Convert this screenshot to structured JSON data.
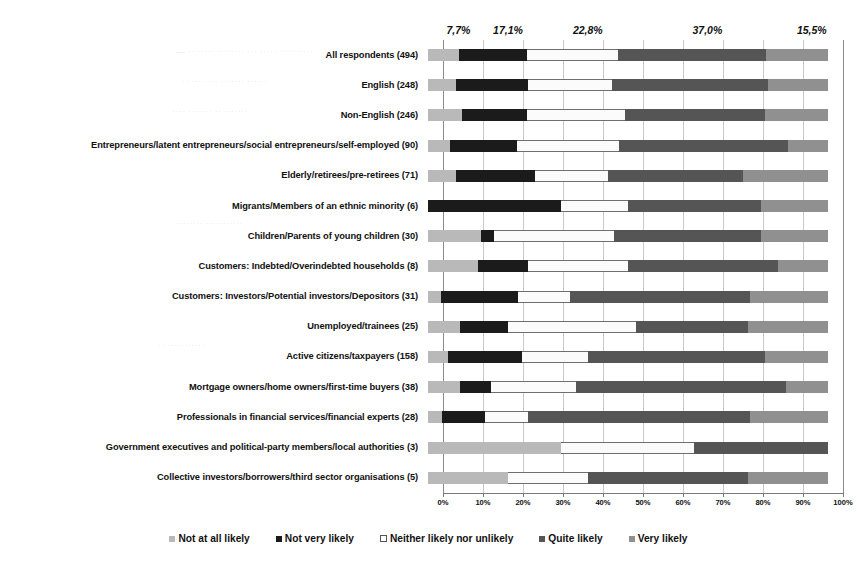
{
  "chart_data": {
    "type": "bar",
    "subtype": "stacked-horizontal-100",
    "title": "",
    "xlabel": "",
    "ylabel": "",
    "xlim": [
      0,
      100
    ],
    "grid": true,
    "legend_position": "bottom",
    "xticks": [
      "0%",
      "10%",
      "20%",
      "30%",
      "40%",
      "50%",
      "60%",
      "70%",
      "80%",
      "90%",
      "100%"
    ],
    "xtick_values": [
      0,
      10,
      20,
      30,
      40,
      50,
      60,
      70,
      80,
      90,
      100
    ],
    "legend": [
      "Not at all likely",
      "Not very likely",
      "Neither likely nor unlikely",
      "Quite likely",
      "Very likely"
    ],
    "series_colors": [
      "#b9b9b9",
      "#1b1b1b",
      "#fbfbfb",
      "#555555",
      "#909090"
    ],
    "top_value_labels": [
      "7,7%",
      "17,1%",
      "22,8%",
      "37,0%",
      "15,5%"
    ],
    "top_value_positions": [
      3.85,
      16.25,
      36.2,
      66.1,
      92.2
    ],
    "categories": [
      "All respondents (494)",
      "English (248)",
      "Non-English (246)",
      "Entrepreneurs/latent entrepreneurs/social entrepreneurs/self-employed (90)",
      "Elderly/retirees/pre-retirees (71)",
      "Migrants/Members of an ethnic minority (6)",
      "Children/Parents of young children (30)",
      "Customers: Indebted/Overindebted households (8)",
      "Customers: Investors/Potential investors/Depositors (31)",
      "Unemployed/trainees (25)",
      "Active citizens/taxpayers (158)",
      "Mortgage owners/home owners/first-time buyers (38)",
      "Professionals in financial services/financial experts (28)",
      "Government executives and political-party members/local authorities (3)",
      "Collective investors/borrowers/third sector organisations (5)"
    ],
    "series": [
      {
        "name": "Not at all likely",
        "values": [
          7.7,
          6.9,
          8.5,
          5.6,
          7.0,
          0.0,
          13.3,
          12.5,
          3.2,
          8.0,
          5.1,
          7.9,
          3.6,
          33.3,
          20.0
        ]
      },
      {
        "name": "Not very likely",
        "values": [
          17.1,
          18.1,
          16.3,
          16.7,
          19.7,
          33.3,
          3.3,
          12.5,
          19.4,
          12.0,
          18.4,
          7.9,
          10.7,
          0.0,
          0.0
        ]
      },
      {
        "name": "Neither likely nor unlikely",
        "values": [
          22.8,
          21.0,
          24.4,
          25.6,
          18.3,
          16.7,
          30.0,
          25.0,
          12.9,
          32.0,
          16.5,
          21.1,
          10.7,
          33.3,
          20.0
        ]
      },
      {
        "name": "Quite likely",
        "values": [
          37.0,
          39.1,
          35.0,
          42.2,
          33.8,
          33.3,
          36.7,
          37.5,
          45.2,
          28.0,
          44.3,
          52.6,
          55.4,
          33.3,
          40.0
        ]
      },
      {
        "name": "Very likely",
        "values": [
          15.5,
          14.9,
          15.8,
          10.0,
          21.1,
          16.7,
          16.7,
          12.5,
          19.4,
          20.0,
          15.7,
          10.5,
          19.6,
          0.0,
          20.0
        ]
      }
    ]
  },
  "ghosts": [
    {
      "x": 176,
      "y": 46,
      "text": "— ·· ····· ········ ··· ····· ··········"
    },
    {
      "x": 182,
      "y": 76,
      "text": "·· ···· ··· ······· ······"
    },
    {
      "x": 172,
      "y": 106,
      "text": "···· ······· ·· ·······"
    },
    {
      "x": 176,
      "y": 218,
      "text": "········ ···········"
    },
    {
      "x": 158,
      "y": 340,
      "text": "·· ···········"
    }
  ]
}
